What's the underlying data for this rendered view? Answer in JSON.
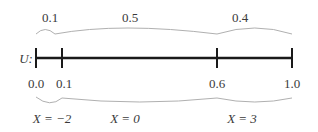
{
  "diagram": {
    "axis_label": "U:",
    "top_probabilities": [
      {
        "label": "0.1",
        "x": 49
      },
      {
        "label": "0.5",
        "x": 138
      },
      {
        "label": "0.4",
        "x": 255
      }
    ],
    "tick_values": [
      {
        "label": "0.0",
        "x": 36
      },
      {
        "label": "0.1",
        "x": 64
      },
      {
        "label": "0.6",
        "x": 217
      },
      {
        "label": "1.0",
        "x": 292
      }
    ],
    "bottom_outcomes": [
      {
        "label": "X = −2",
        "x": 49
      },
      {
        "label": "X = 0",
        "x": 138
      },
      {
        "label": "X = 3",
        "x": 255
      }
    ],
    "colors": {
      "line": "#1a1a1a",
      "brace": "#b0b0b0",
      "text": "#3a3a3a"
    }
  }
}
